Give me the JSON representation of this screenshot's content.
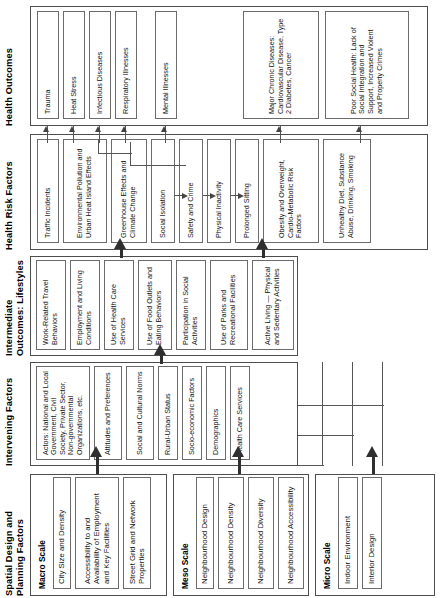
{
  "diagram": {
    "orientation": "rotated-90-ccw",
    "columns": [
      {
        "id": "spatial",
        "title": "Spatial Design and Planning Factors",
        "groups": [
          {
            "scale_label": "Macro Scale",
            "nodes": [
              "City Size and Density",
              "Accessibility to and Availability of Employment and Key Facilities",
              "Street Grid and Network Properties"
            ]
          },
          {
            "scale_label": "Meso Scale",
            "nodes": [
              "Neighbourhood Design",
              "Neighbourhood Density",
              "Neighbourhood Diversity",
              "Neighbourhood Accessibility"
            ]
          },
          {
            "scale_label": "Micro Scale",
            "nodes": [
              "Indoor Environment",
              "Interior Design"
            ]
          }
        ]
      },
      {
        "id": "intervening",
        "title": "Intervening Factors",
        "nodes": [
          "Actors: National and Local Government, Civil Society, Private Sector, Non-governmental Organizations, etc.",
          "Attitudes and Preferences",
          "Social and Cultural Norms",
          "Rural-Urban Status",
          "Socio-economic Factors",
          "Demographics",
          "Health Care Services"
        ]
      },
      {
        "id": "intermediate",
        "title": "Intermediate Outcomes: Lifestyles",
        "nodes": [
          "Work-Related Travel Behaviors",
          "Employment and Living Conditions",
          "Use of Health Care Services",
          "Use of Food Outlets and Eating Behaviors",
          "Participation in Social Activities",
          "Use of Parks and Recreational Facilities",
          "Active Living — Physical and Sedentary Activities"
        ]
      },
      {
        "id": "risk",
        "title": "Health Risk Factors",
        "nodes": [
          "Traffic Incidents",
          "Environmental Pollution and Urban Heat Island Effects",
          "Greenhouse Effects and Climate Change",
          "Social Isolation",
          "Safety and Crime",
          "Physical Inactivity",
          "Prolonged Sitting",
          "Obesity and Overweight, Cardio-Metabolic Risk Factors",
          "Unhealthy Diet, Substance Abuse, Drinking, Smoking"
        ]
      },
      {
        "id": "outcomes",
        "title": "Health Outcomes",
        "nodes": [
          "Trauma",
          "Heat Stress",
          "Infectious Diseases",
          "Respiratory Illnesses",
          "Mental Illnesses",
          "Major Chronic Diseases: Cardiovascular Disease, Type 2 Diabetes, Cancer",
          "Poor Social Health: Lack of Social Integration and Support, Increased Violent and Property Crimes"
        ]
      }
    ],
    "colors": {
      "box_border": "#4d4d4d",
      "node_border": "#6b6b6b",
      "arrow": "#444444",
      "thick_arrow": "#2f2f2f",
      "background": "#ffffff",
      "text": "#111111"
    }
  }
}
